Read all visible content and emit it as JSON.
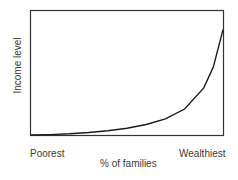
{
  "chart_data": {
    "type": "line",
    "title": "",
    "xlabel": "% of families",
    "ylabel": "Income level",
    "x_tick_labels": {
      "min": "Poorest",
      "max": "Wealthiest"
    },
    "grid": false,
    "legend": null,
    "series": [
      {
        "name": "Income distribution",
        "x": [
          0,
          0.1,
          0.2,
          0.3,
          0.4,
          0.5,
          0.6,
          0.7,
          0.8,
          0.9,
          0.95,
          1.0
        ],
        "y": [
          0,
          0.003,
          0.01,
          0.02,
          0.035,
          0.055,
          0.085,
          0.13,
          0.21,
          0.38,
          0.55,
          0.85
        ]
      }
    ],
    "xlim": [
      0,
      1
    ],
    "ylim": [
      0,
      1
    ],
    "colors": {
      "line": "#1a1a1a",
      "axes": "#333333"
    }
  }
}
